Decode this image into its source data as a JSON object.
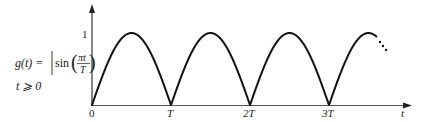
{
  "chart_data": {
    "type": "line",
    "title": "",
    "function_label": "g(t) = |sin(πt/T)|",
    "condition_label": "t ⩾ 0",
    "xlabel": "t",
    "ylabel": "",
    "x_ticks": [
      "0",
      "T",
      "2T",
      "3T"
    ],
    "y_ticks": [
      "1"
    ],
    "xlim_periods": [
      0,
      3.65
    ],
    "ylim": [
      0,
      1
    ],
    "grid": false,
    "legend": null,
    "continuation": "dotted ellipsis after last partial arch",
    "series": [
      {
        "name": "g(t)",
        "x": [
          0,
          0.25,
          0.5,
          0.75,
          1,
          1.25,
          1.5,
          1.75,
          2,
          2.25,
          2.5,
          2.75,
          3,
          3.25,
          3.5
        ],
        "x_units": "T",
        "values": [
          0,
          0.707,
          1,
          0.707,
          0,
          0.707,
          1,
          0.707,
          0,
          0.707,
          1,
          0.707,
          0,
          0.707,
          1
        ]
      }
    ]
  },
  "labels": {
    "origin": "0",
    "tick_T": "T",
    "tick_2T": "2T",
    "tick_3T": "3T",
    "axis_t": "t",
    "y_one": "1",
    "g_of_t": "g(t) =",
    "sin": "sin",
    "pi_t": "πt",
    "T_den": "T",
    "condition": "t ⩾ 0"
  },
  "colors": {
    "curve": "#111111",
    "axis": "#333333",
    "text": "#222222"
  }
}
